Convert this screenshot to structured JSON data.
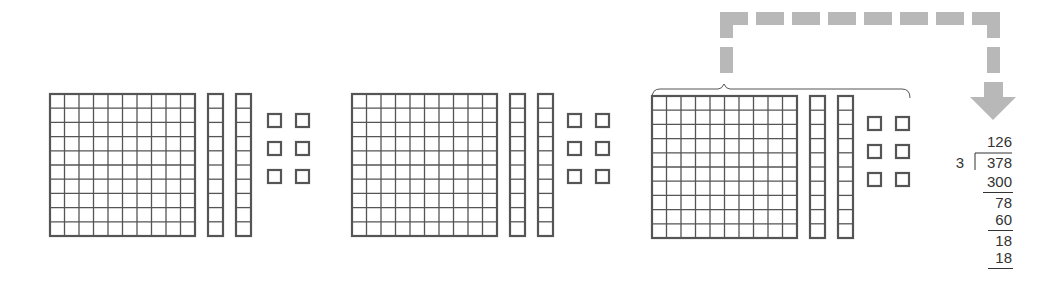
{
  "diagram": {
    "groups": [
      {
        "id": "group-1",
        "hundreds": 1,
        "tens": 2,
        "ones": 6,
        "flat": {
          "x": 50,
          "y": 94
        },
        "rods_x": [
          208,
          236
        ],
        "units_x": [
          267,
          295
        ],
        "units_y": [
          113,
          141,
          169
        ]
      },
      {
        "id": "group-2",
        "hundreds": 1,
        "tens": 2,
        "ones": 6,
        "flat": {
          "x": 352,
          "y": 94
        },
        "rods_x": [
          510,
          538
        ],
        "units_x": [
          567,
          595
        ],
        "units_y": [
          113,
          141,
          169
        ]
      },
      {
        "id": "group-3",
        "hundreds": 1,
        "tens": 2,
        "ones": 6,
        "flat": {
          "x": 652,
          "y": 96
        },
        "rods_x": [
          810,
          838
        ],
        "units_x": [
          867,
          895
        ],
        "units_y": [
          116,
          144,
          172
        ]
      }
    ],
    "highlighted_group": "group-3",
    "arrow_color": "#b8b8b8",
    "block_line_color": "#555555"
  },
  "long_division": {
    "quotient": "126",
    "divisor": "3",
    "dividend": "378",
    "steps": [
      "300",
      "78",
      "60",
      "18",
      "18"
    ]
  }
}
